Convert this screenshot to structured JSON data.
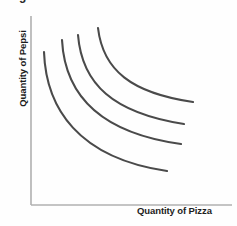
{
  "figure": {
    "caption": "Figure 21-2",
    "caption_clipped": true
  },
  "axes": {
    "x_label": "Quantity of Pizza",
    "y_label": "Quantity of Pepsi",
    "axis_color": "#b0b0b0",
    "label_color": "#1c1c1c"
  },
  "style": {
    "background": "#fefefe",
    "curve_color": "#4a4a4a",
    "curve_width": 2.1
  },
  "chart_data": {
    "type": "line",
    "title": "Figure 21-2",
    "xlabel": "Quantity of Pizza",
    "ylabel": "Quantity of Pepsi",
    "grid": false,
    "legend": "none",
    "xlim": [
      0,
      100
    ],
    "ylim": [
      0,
      100
    ],
    "series": [
      {
        "name": "I1",
        "label": "Indifference curve 1 (lowest utility)",
        "path": "M 44 52 C 46 108, 78 158, 167 171",
        "start": [
          44,
          52
        ],
        "end": [
          167,
          171
        ]
      },
      {
        "name": "I2",
        "label": "Indifference curve 2",
        "path": "M 62 40 C 65 96, 101 133, 181 144",
        "start": [
          62,
          40
        ],
        "end": [
          181,
          144
        ]
      },
      {
        "name": "I3",
        "label": "Indifference curve 3",
        "path": "M 78 35 C 82 84, 113 113, 184 124",
        "start": [
          78,
          35
        ],
        "end": [
          184,
          124
        ]
      },
      {
        "name": "I4",
        "label": "Indifference curve 4 (highest utility)",
        "path": "M 98 28 C 103 70, 131 93, 193 102",
        "start": [
          98,
          28
        ],
        "end": [
          193,
          102
        ]
      }
    ],
    "axis_lines": {
      "y_axis": {
        "x": 31,
        "y_top": 16,
        "y_bottom": 205
      },
      "x_axis": {
        "y": 205,
        "x_left": 31,
        "x_right": 232
      }
    }
  }
}
